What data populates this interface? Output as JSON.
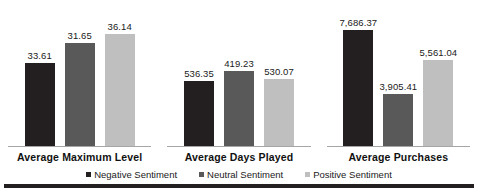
{
  "chart_data": {
    "type": "bar",
    "title": "",
    "subtitle": "",
    "xlabel": "",
    "ylabel": "",
    "grid": false,
    "legend_position": "bottom",
    "axis_note": "each category group is scaled independently (panel/clustered groups, no shared y-axis, no y tick labels)",
    "categories": [
      "Average Maximum Level",
      "Average Days Played",
      "Average Purchases"
    ],
    "series": [
      {
        "name": "Negative Sentiment",
        "color": "#231f20",
        "values": [
          33.61,
          536.35,
          7686.37
        ],
        "labels": [
          "33.61",
          "536.35",
          "7,686.37"
        ]
      },
      {
        "name": "Neutral Sentiment",
        "color": "#595959",
        "values": [
          31.65,
          419.23,
          3905.41
        ],
        "labels": [
          "31.65",
          "419.23",
          "3,905.41"
        ]
      },
      {
        "name": "Positive Sentiment",
        "color": "#bfbfbf",
        "values": [
          36.14,
          530.07,
          5561.04
        ],
        "labels": [
          "36.14",
          "530.07",
          "5,561.04"
        ]
      }
    ],
    "bar_pixel_heights": [
      [
        84,
        104,
        113
      ],
      [
        66,
        76,
        68
      ],
      [
        117,
        53,
        87
      ]
    ]
  },
  "legend": {
    "items": [
      {
        "label": "Negative Sentiment",
        "color": "#231f20"
      },
      {
        "label": "Neutral Sentiment",
        "color": "#595959"
      },
      {
        "label": "Positive Sentiment",
        "color": "#bfbfbf"
      }
    ]
  },
  "colors": {
    "negative": "#231f20",
    "neutral": "#595959",
    "positive": "#bfbfbf",
    "axis": "#a6a6a6",
    "rule": "#231f20",
    "text": "#1a1a1a",
    "background": "#ffffff"
  }
}
